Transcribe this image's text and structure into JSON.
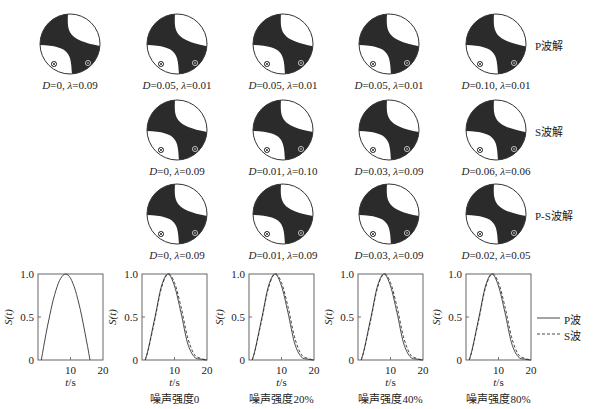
{
  "figure": {
    "row_labels": [
      "P波解",
      "S波解",
      "P-S波解"
    ],
    "beachballs": [
      {
        "row": 0,
        "col": 0,
        "D": "0",
        "lambda": "0.09",
        "label": "D=0, λ=0.09"
      },
      {
        "row": 0,
        "col": 1,
        "D": "0.05",
        "lambda": "0.01",
        "label": "D=0.05, λ=0.01"
      },
      {
        "row": 0,
        "col": 2,
        "D": "0.05",
        "lambda": "0.01",
        "label": "D=0.05, λ=0.01"
      },
      {
        "row": 0,
        "col": 3,
        "D": "0.05",
        "lambda": "0.01",
        "label": "D=0.05, λ=0.01"
      },
      {
        "row": 0,
        "col": 4,
        "D": "0.10",
        "lambda": "0.01",
        "label": "D=0.10, λ=0.01"
      },
      {
        "row": 1,
        "col": 1,
        "D": "0",
        "lambda": "0.09",
        "label": "D=0, λ=0.09"
      },
      {
        "row": 1,
        "col": 2,
        "D": "0.01",
        "lambda": "0.10",
        "label": "D=0.01, λ=0.10"
      },
      {
        "row": 1,
        "col": 3,
        "D": "0.03",
        "lambda": "0.09",
        "label": "D=0.03, λ=0.09"
      },
      {
        "row": 1,
        "col": 4,
        "D": "0.06",
        "lambda": "0.06",
        "label": "D=0.06, λ=0.06"
      },
      {
        "row": 2,
        "col": 1,
        "D": "0",
        "lambda": "0.09",
        "label": "D=0, λ=0.09"
      },
      {
        "row": 2,
        "col": 2,
        "D": "0.01",
        "lambda": "0.09",
        "label": "D=0.01, λ=0.09"
      },
      {
        "row": 2,
        "col": 3,
        "D": "0.03",
        "lambda": "0.09",
        "label": "D=0.03, λ=0.09"
      },
      {
        "row": 2,
        "col": 4,
        "D": "0.02",
        "lambda": "0.05",
        "label": "D=0.02, λ=0.05"
      }
    ],
    "captions": [
      "",
      "噪声强度0",
      "噪声强度20%",
      "噪声强度40%",
      "噪声强度80%"
    ],
    "legend": [
      {
        "name": "P波",
        "style": "solid"
      },
      {
        "name": "S波",
        "style": "dashed"
      }
    ],
    "colors": {
      "fill": "#2b2b2b",
      "line": "#333333",
      "background": "#ffffff"
    }
  },
  "chart_data": [
    {
      "type": "line",
      "title": "",
      "xlabel": "t/s",
      "ylabel": "S(t)",
      "xlim": [
        0,
        20
      ],
      "ylim": [
        0,
        1.0
      ],
      "xticks": [
        "10",
        "20"
      ],
      "yticks": [
        "0",
        "0.5",
        "1.0"
      ],
      "grid": false,
      "series": [
        {
          "name": "true source time function",
          "style": "solid",
          "x": [
            1,
            2,
            3,
            4,
            5,
            6,
            7,
            8,
            9,
            10,
            11,
            12,
            13,
            14,
            15,
            16
          ],
          "y": [
            0,
            0.19,
            0.38,
            0.56,
            0.72,
            0.85,
            0.94,
            0.99,
            0.99,
            0.94,
            0.85,
            0.72,
            0.56,
            0.38,
            0.19,
            0
          ]
        }
      ]
    },
    {
      "type": "line",
      "title": "噪声强度0",
      "xlabel": "t/s",
      "ylabel": "S(t)",
      "xlim": [
        0,
        20
      ],
      "ylim": [
        0,
        1.0
      ],
      "xticks": [
        "10",
        "20"
      ],
      "yticks": [
        "0",
        "0.5",
        "1.0"
      ],
      "series": [
        {
          "name": "P波",
          "style": "solid",
          "x": [
            1,
            2,
            4,
            6,
            8,
            10,
            12,
            14,
            16,
            18,
            20
          ],
          "y": [
            0,
            0.14,
            0.5,
            0.86,
            1.0,
            0.86,
            0.55,
            0.2,
            0.04,
            0.01,
            0
          ]
        },
        {
          "name": "S波",
          "style": "dashed",
          "x": [
            1,
            2,
            4,
            6,
            8,
            10,
            12,
            14,
            16,
            18,
            20
          ],
          "y": [
            0,
            0.13,
            0.48,
            0.84,
            1.0,
            0.9,
            0.62,
            0.27,
            0.07,
            0.02,
            0
          ]
        }
      ]
    },
    {
      "type": "line",
      "title": "噪声强度20%",
      "xlabel": "t/s",
      "ylabel": "S(t)",
      "xlim": [
        0,
        20
      ],
      "ylim": [
        0,
        1.0
      ],
      "xticks": [
        "10",
        "20"
      ],
      "yticks": [
        "0",
        "0.5",
        "1.0"
      ],
      "series": [
        {
          "name": "P波",
          "style": "solid",
          "x": [
            1,
            2,
            4,
            6,
            8,
            10,
            12,
            14,
            16,
            18,
            20
          ],
          "y": [
            0,
            0.14,
            0.5,
            0.86,
            1.0,
            0.86,
            0.55,
            0.2,
            0.04,
            0.01,
            0
          ]
        },
        {
          "name": "S波",
          "style": "dashed",
          "x": [
            1,
            2,
            4,
            6,
            8,
            10,
            12,
            14,
            16,
            18,
            20
          ],
          "y": [
            0,
            0.13,
            0.48,
            0.84,
            1.0,
            0.9,
            0.62,
            0.27,
            0.07,
            0.02,
            0
          ]
        }
      ]
    },
    {
      "type": "line",
      "title": "噪声强度40%",
      "xlabel": "t/s",
      "ylabel": "S(t)",
      "xlim": [
        0,
        20
      ],
      "ylim": [
        0,
        1.0
      ],
      "xticks": [
        "10",
        "20"
      ],
      "yticks": [
        "0",
        "0.5",
        "1.0"
      ],
      "series": [
        {
          "name": "P波",
          "style": "solid",
          "x": [
            1,
            2,
            4,
            6,
            8,
            10,
            12,
            14,
            16,
            18,
            20
          ],
          "y": [
            0,
            0.14,
            0.5,
            0.86,
            1.0,
            0.86,
            0.55,
            0.2,
            0.04,
            0.01,
            0
          ]
        },
        {
          "name": "S波",
          "style": "dashed",
          "x": [
            1,
            2,
            4,
            6,
            8,
            10,
            12,
            14,
            16,
            18,
            20
          ],
          "y": [
            0,
            0.13,
            0.48,
            0.84,
            1.0,
            0.9,
            0.62,
            0.27,
            0.07,
            0.02,
            0
          ]
        }
      ]
    },
    {
      "type": "line",
      "title": "噪声强度80%",
      "xlabel": "t/s",
      "ylabel": "S(t)",
      "xlim": [
        0,
        20
      ],
      "ylim": [
        0,
        1.0
      ],
      "xticks": [
        "10",
        "20"
      ],
      "yticks": [
        "0",
        "0.5",
        "1.0"
      ],
      "series": [
        {
          "name": "P波",
          "style": "solid",
          "x": [
            1,
            2,
            4,
            6,
            8,
            10,
            12,
            14,
            16,
            18,
            20
          ],
          "y": [
            0,
            0.14,
            0.5,
            0.86,
            1.0,
            0.86,
            0.55,
            0.2,
            0.04,
            0.01,
            0
          ]
        },
        {
          "name": "S波",
          "style": "dashed",
          "x": [
            1,
            2,
            4,
            6,
            8,
            10,
            12,
            14,
            16,
            18,
            20
          ],
          "y": [
            0,
            0.13,
            0.48,
            0.84,
            1.0,
            0.9,
            0.62,
            0.27,
            0.07,
            0.02,
            0
          ]
        }
      ]
    }
  ]
}
